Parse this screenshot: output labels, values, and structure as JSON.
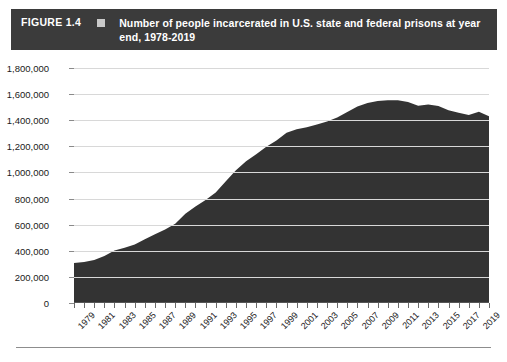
{
  "header": {
    "figure_number": "FIGURE 1.4",
    "marker": "square-marker",
    "title": "Number of people incarcerated in U.S. state and federal prisons at year end, 1978-2019",
    "bar_color": "#3b3b3b",
    "marker_color": "#c9c9c9",
    "text_color": "#ffffff"
  },
  "chart_data": {
    "type": "area",
    "title": "Number of people incarcerated in U.S. state and federal prisons at year end, 1978-2019",
    "xlabel": "",
    "ylabel": "",
    "ylim": [
      0,
      1800000
    ],
    "xlim": [
      1978,
      2019
    ],
    "grid": true,
    "legend": "none",
    "area_color": "#333333",
    "gridline_color": "#d8d8d8",
    "y_ticks": [
      0,
      200000,
      400000,
      600000,
      800000,
      1000000,
      1200000,
      1400000,
      1600000,
      1800000
    ],
    "y_tick_labels": [
      "0",
      "200,000",
      "400,000",
      "600,000",
      "800,000",
      "1,000,000",
      "1,200,000",
      "1,400,000",
      "1,600,000",
      "1,800,000"
    ],
    "x_tick_labels": [
      "1979",
      "1981",
      "1983",
      "1985",
      "1987",
      "1989",
      "1991",
      "1993",
      "1995",
      "1997",
      "1999",
      "2001",
      "2003",
      "2005",
      "2007",
      "2009",
      "2011",
      "2013",
      "2015",
      "2017",
      "2019"
    ],
    "x": [
      1978,
      1979,
      1980,
      1981,
      1982,
      1983,
      1984,
      1985,
      1986,
      1987,
      1988,
      1989,
      1990,
      1991,
      1992,
      1993,
      1994,
      1995,
      1996,
      1997,
      1998,
      1999,
      2000,
      2001,
      2002,
      2003,
      2004,
      2005,
      2006,
      2007,
      2008,
      2009,
      2010,
      2011,
      2012,
      2013,
      2014,
      2015,
      2016,
      2017,
      2018,
      2019
    ],
    "values": [
      307276,
      314457,
      329821,
      360029,
      402914,
      423898,
      448264,
      487593,
      526436,
      562814,
      607766,
      683367,
      739980,
      789610,
      846277,
      932074,
      1016691,
      1085022,
      1138984,
      1197590,
      1245402,
      1304074,
      1331278,
      1345217,
      1367547,
      1390279,
      1421345,
      1462866,
      1504598,
      1532851,
      1547742,
      1553574,
      1552669,
      1538847,
      1511183,
      1520403,
      1508636,
      1476847,
      1458173,
      1439808,
      1464400,
      1430800
    ],
    "series_name": "People incarcerated"
  },
  "footer": {
    "rule": "horizontal-rule"
  }
}
